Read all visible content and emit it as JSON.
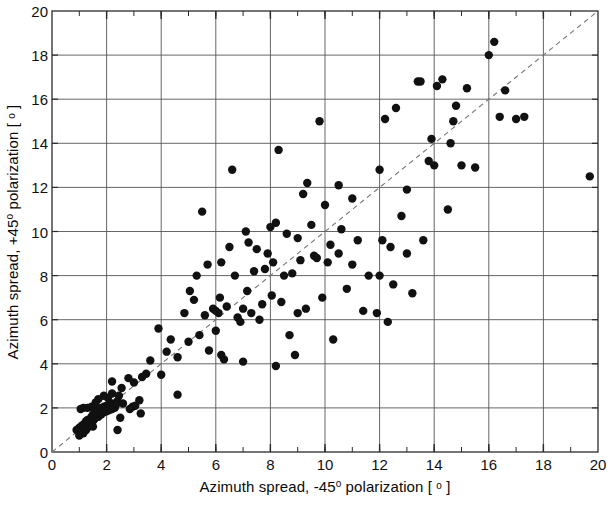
{
  "chart_data": {
    "type": "scatter",
    "title": "",
    "xlabel": "Azimuth spread, -45° polarization [ ° ]",
    "ylabel": "Azimuth spread, +45° polarization [ ° ]",
    "xlabel_parts": {
      "pre": "Azimuth spread, -45",
      "deg1": "o",
      "mid": " polarization [ ",
      "deg2": "o",
      "post": " ]"
    },
    "ylabel_parts": {
      "pre": "Azimuth spread, +45",
      "deg1": "o",
      "mid": " polarization [ ",
      "deg2": "o",
      "post": " ]"
    },
    "xlim": [
      0,
      20
    ],
    "ylim": [
      0,
      20
    ],
    "xticks": [
      0,
      2,
      4,
      6,
      8,
      10,
      12,
      14,
      16,
      18,
      20
    ],
    "yticks": [
      0,
      2,
      4,
      6,
      8,
      10,
      12,
      14,
      16,
      18,
      20
    ],
    "x_minor_tick_step": 1,
    "grid": true,
    "grid_step": 2,
    "grid_color": "#555555",
    "marker_color": "#111111",
    "marker_size": 7,
    "legend": "none",
    "reference_line": {
      "type": "identity",
      "style": "dashed",
      "from": [
        0,
        0
      ],
      "to": [
        20,
        20
      ],
      "color": "#777777"
    },
    "points": [
      [
        0.9,
        1.0
      ],
      [
        1.0,
        1.1
      ],
      [
        1.0,
        0.9
      ],
      [
        1.1,
        1.2
      ],
      [
        1.1,
        1.0
      ],
      [
        1.2,
        1.3
      ],
      [
        1.2,
        1.1
      ],
      [
        1.25,
        1.4
      ],
      [
        1.3,
        1.2
      ],
      [
        1.3,
        1.45
      ],
      [
        1.35,
        1.3
      ],
      [
        1.4,
        1.5
      ],
      [
        1.4,
        1.25
      ],
      [
        1.45,
        1.6
      ],
      [
        1.5,
        1.4
      ],
      [
        1.5,
        1.7
      ],
      [
        1.55,
        1.5
      ],
      [
        1.6,
        1.8
      ],
      [
        1.6,
        1.55
      ],
      [
        1.65,
        1.9
      ],
      [
        1.7,
        1.6
      ],
      [
        1.7,
        1.95
      ],
      [
        1.75,
        1.75
      ],
      [
        1.8,
        2.0
      ],
      [
        1.8,
        1.7
      ],
      [
        1.85,
        1.85
      ],
      [
        1.9,
        2.05
      ],
      [
        1.9,
        1.8
      ],
      [
        1.95,
        1.95
      ],
      [
        2.0,
        2.1
      ],
      [
        2.0,
        1.85
      ],
      [
        2.05,
        2.0
      ],
      [
        2.1,
        2.15
      ],
      [
        2.1,
        1.9
      ],
      [
        2.15,
        2.05
      ],
      [
        2.2,
        2.2
      ],
      [
        2.2,
        1.95
      ],
      [
        2.25,
        2.1
      ],
      [
        2.3,
        2.0
      ],
      [
        2.35,
        2.15
      ],
      [
        1.15,
        2.0
      ],
      [
        1.3,
        2.0
      ],
      [
        1.45,
        2.05
      ],
      [
        1.05,
        1.95
      ],
      [
        1.6,
        2.25
      ],
      [
        1.7,
        2.4
      ],
      [
        1.9,
        2.55
      ],
      [
        2.05,
        2.45
      ],
      [
        2.2,
        2.65
      ],
      [
        2.4,
        2.3
      ],
      [
        1.35,
        1.15
      ],
      [
        1.5,
        1.15
      ],
      [
        1.25,
        1.0
      ],
      [
        1.15,
        0.85
      ],
      [
        1.0,
        0.75
      ],
      [
        2.4,
        1.0
      ],
      [
        2.55,
        2.9
      ],
      [
        2.8,
        3.35
      ],
      [
        2.95,
        2.05
      ],
      [
        3.05,
        2.1
      ],
      [
        3.2,
        2.35
      ],
      [
        3.25,
        1.75
      ],
      [
        3.3,
        3.4
      ],
      [
        3.45,
        3.55
      ],
      [
        2.6,
        2.2
      ],
      [
        2.85,
        1.95
      ],
      [
        3.0,
        3.15
      ],
      [
        2.45,
        2.55
      ],
      [
        2.2,
        3.2
      ],
      [
        2.5,
        1.55
      ],
      [
        3.6,
        4.15
      ],
      [
        4.0,
        3.5
      ],
      [
        4.2,
        4.55
      ],
      [
        4.35,
        5.1
      ],
      [
        4.6,
        4.3
      ],
      [
        4.85,
        6.3
      ],
      [
        5.0,
        5.0
      ],
      [
        5.05,
        7.3
      ],
      [
        5.2,
        6.9
      ],
      [
        5.3,
        8.0
      ],
      [
        5.4,
        5.3
      ],
      [
        5.5,
        10.9
      ],
      [
        5.6,
        6.2
      ],
      [
        5.7,
        8.5
      ],
      [
        5.75,
        4.6
      ],
      [
        5.9,
        6.5
      ],
      [
        6.0,
        6.4
      ],
      [
        6.0,
        5.5
      ],
      [
        6.1,
        6.3
      ],
      [
        6.15,
        7.0
      ],
      [
        6.2,
        4.4
      ],
      [
        6.3,
        4.2
      ],
      [
        6.4,
        6.6
      ],
      [
        6.5,
        9.3
      ],
      [
        6.6,
        12.8
      ],
      [
        6.7,
        8.0
      ],
      [
        6.8,
        6.1
      ],
      [
        6.9,
        5.9
      ],
      [
        7.0,
        6.5
      ],
      [
        7.1,
        10.0
      ],
      [
        7.15,
        7.3
      ],
      [
        7.2,
        9.5
      ],
      [
        7.3,
        6.3
      ],
      [
        7.4,
        8.2
      ],
      [
        7.5,
        9.2
      ],
      [
        7.6,
        6.0
      ],
      [
        7.7,
        6.7
      ],
      [
        7.8,
        8.3
      ],
      [
        7.9,
        9.0
      ],
      [
        8.0,
        10.2
      ],
      [
        8.05,
        7.1
      ],
      [
        8.1,
        8.6
      ],
      [
        8.2,
        10.4
      ],
      [
        8.3,
        13.7
      ],
      [
        8.4,
        6.8
      ],
      [
        8.5,
        8.0
      ],
      [
        8.6,
        9.9
      ],
      [
        8.7,
        5.3
      ],
      [
        8.8,
        8.1
      ],
      [
        8.9,
        4.4
      ],
      [
        9.0,
        9.7
      ],
      [
        9.1,
        8.7
      ],
      [
        9.2,
        11.7
      ],
      [
        9.3,
        6.5
      ],
      [
        9.35,
        12.2
      ],
      [
        9.5,
        10.3
      ],
      [
        9.6,
        8.9
      ],
      [
        9.7,
        8.8
      ],
      [
        9.8,
        15.0
      ],
      [
        9.9,
        7.0
      ],
      [
        10.0,
        11.2
      ],
      [
        10.1,
        8.6
      ],
      [
        10.2,
        9.4
      ],
      [
        10.3,
        5.1
      ],
      [
        10.5,
        9.0
      ],
      [
        10.6,
        10.1
      ],
      [
        10.8,
        7.4
      ],
      [
        11.0,
        8.5
      ],
      [
        11.2,
        9.6
      ],
      [
        11.4,
        6.4
      ],
      [
        11.6,
        8.0
      ],
      [
        11.9,
        6.3
      ],
      [
        12.0,
        12.8
      ],
      [
        12.1,
        9.6
      ],
      [
        12.2,
        15.1
      ],
      [
        12.3,
        5.9
      ],
      [
        12.4,
        9.3
      ],
      [
        12.5,
        7.6
      ],
      [
        12.6,
        15.6
      ],
      [
        12.8,
        10.7
      ],
      [
        13.0,
        9.0
      ],
      [
        13.2,
        7.2
      ],
      [
        13.4,
        16.8
      ],
      [
        13.5,
        16.8
      ],
      [
        13.6,
        9.6
      ],
      [
        13.8,
        13.2
      ],
      [
        13.9,
        14.2
      ],
      [
        14.0,
        13.0
      ],
      [
        14.1,
        16.6
      ],
      [
        14.3,
        16.9
      ],
      [
        14.5,
        11.0
      ],
      [
        14.6,
        14.0
      ],
      [
        14.7,
        15.0
      ],
      [
        14.8,
        15.7
      ],
      [
        15.0,
        13.0
      ],
      [
        15.2,
        16.5
      ],
      [
        15.5,
        12.9
      ],
      [
        16.0,
        18.0
      ],
      [
        16.2,
        18.6
      ],
      [
        16.4,
        15.2
      ],
      [
        16.6,
        16.4
      ],
      [
        17.0,
        15.1
      ],
      [
        17.3,
        15.2
      ],
      [
        19.7,
        12.5
      ],
      [
        4.6,
        2.6
      ],
      [
        3.9,
        5.6
      ],
      [
        6.2,
        8.6
      ],
      [
        10.5,
        12.1
      ],
      [
        11.0,
        11.5
      ],
      [
        7.0,
        4.1
      ],
      [
        8.2,
        3.9
      ],
      [
        9.0,
        6.3
      ],
      [
        12.0,
        8.0
      ],
      [
        13.0,
        11.9
      ]
    ]
  }
}
